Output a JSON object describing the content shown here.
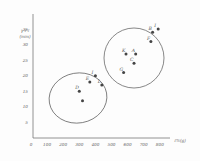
{
  "chart_data": {
    "type": "scatter",
    "title": "",
    "xlabel": "ℓ%(g)",
    "ylabel": "γ  ℓ'ℓ (mm)",
    "ylabel_line1": "γ ℓ'ℓ",
    "ylabel_line2": "(mm)",
    "xlim": [
      0,
      900
    ],
    "ylim": [
      0,
      40
    ],
    "grid": false,
    "x_ticks": [
      0,
      100,
      200,
      300,
      400,
      500,
      600,
      700,
      800
    ],
    "y_ticks": [
      5,
      10,
      15,
      20,
      25,
      30,
      35
    ],
    "x_tick_labels": [
      "0",
      "100",
      "200",
      "300",
      "400",
      "500",
      "600",
      "700",
      "800"
    ],
    "y_tick_labels": [
      "5",
      "10",
      "15",
      "20",
      "25",
      "30",
      "35"
    ],
    "clusters": [
      {
        "name": "cluster-1",
        "shape": "ellipse",
        "points": [
          {
            "label": "D",
            "x": 300,
            "y": 15
          },
          {
            "label": "",
            "x": 320,
            "y": 12
          },
          {
            "label": "E",
            "x": 365,
            "y": 18
          },
          {
            "label": "I",
            "x": 400,
            "y": 20
          },
          {
            "label": "L",
            "x": 440,
            "y": 17
          }
        ]
      },
      {
        "name": "cluster-2",
        "shape": "ellipse",
        "points": [
          {
            "label": "K",
            "x": 590,
            "y": 27
          },
          {
            "label": "A",
            "x": 650,
            "y": 27
          },
          {
            "label": "C",
            "x": 640,
            "y": 24
          },
          {
            "label": "G",
            "x": 575,
            "y": 21
          },
          {
            "label": "F",
            "x": 745,
            "y": 31
          },
          {
            "label": "B",
            "x": 755,
            "y": 34
          },
          {
            "label": "I",
            "x": 790,
            "y": 35
          }
        ]
      }
    ],
    "legend": null
  }
}
